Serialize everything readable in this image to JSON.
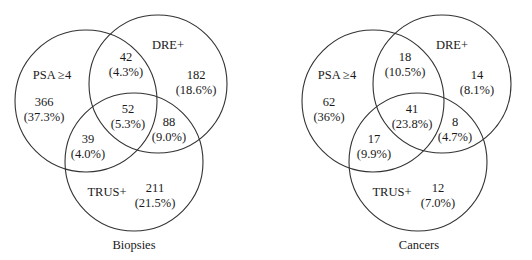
{
  "colors": {
    "background": "#ffffff",
    "stroke": "#333333",
    "text": "#1a1a1a"
  },
  "diagrams": [
    {
      "id": "biopsies",
      "caption": "Biopsies",
      "caption_pos": [
        134,
        246
      ],
      "sets": [
        {
          "name": "psa",
          "label": "PSA ≥4",
          "cx": 86,
          "cy": 101,
          "r": 71,
          "label_pos": [
            52,
            76
          ]
        },
        {
          "name": "dre",
          "label": "DRE+",
          "cx": 158,
          "cy": 84,
          "r": 69,
          "label_pos": [
            168,
            46
          ]
        },
        {
          "name": "trus",
          "label": "TRUS+",
          "cx": 134,
          "cy": 162,
          "r": 69,
          "label_pos": [
            107,
            193
          ]
        }
      ],
      "regions": [
        {
          "name": "psa-only",
          "count": "366",
          "pct": "(37.3%)",
          "pos": [
            44,
            103
          ]
        },
        {
          "name": "psa-dre",
          "count": "42",
          "pct": "(4.3%)",
          "pos": [
            126,
            58
          ]
        },
        {
          "name": "dre-only",
          "count": "182",
          "pct": "(18.6%)",
          "pos": [
            196,
            76
          ]
        },
        {
          "name": "psa-dre-trus",
          "count": "52",
          "pct": "(5.3%)",
          "pos": [
            128,
            110
          ]
        },
        {
          "name": "dre-trus",
          "count": "88",
          "pct": "(9.0%)",
          "pos": [
            169,
            123
          ]
        },
        {
          "name": "psa-trus",
          "count": "39",
          "pct": "(4.0%)",
          "pos": [
            88,
            140
          ]
        },
        {
          "name": "trus-only",
          "count": "211",
          "pct": "(21.5%)",
          "pos": [
            155,
            189
          ]
        }
      ]
    },
    {
      "id": "cancers",
      "caption": "Cancers",
      "caption_pos": [
        419,
        246
      ],
      "sets": [
        {
          "name": "psa",
          "label": "PSA ≥4",
          "cx": 373,
          "cy": 101,
          "r": 71,
          "label_pos": [
            337,
            76
          ]
        },
        {
          "name": "dre",
          "label": "DRE+",
          "cx": 442,
          "cy": 84,
          "r": 69,
          "label_pos": [
            452,
            46
          ]
        },
        {
          "name": "trus",
          "label": "TRUS+",
          "cx": 418,
          "cy": 162,
          "r": 69,
          "label_pos": [
            392,
            193
          ]
        }
      ],
      "regions": [
        {
          "name": "psa-only",
          "count": "62",
          "pct": "(36%)",
          "pos": [
            329,
            103
          ]
        },
        {
          "name": "psa-dre",
          "count": "18",
          "pct": "(10.5%)",
          "pos": [
            405,
            58
          ]
        },
        {
          "name": "dre-only",
          "count": "14",
          "pct": "(8.1%)",
          "pos": [
            477,
            76
          ]
        },
        {
          "name": "psa-dre-trus",
          "count": "41",
          "pct": "(23.8%)",
          "pos": [
            412,
            110
          ]
        },
        {
          "name": "dre-trus",
          "count": "8",
          "pct": "(4.7%)",
          "pos": [
            455,
            123
          ]
        },
        {
          "name": "psa-trus",
          "count": "17",
          "pct": "(9.9%)",
          "pos": [
            374,
            140
          ]
        },
        {
          "name": "trus-only",
          "count": "12",
          "pct": "(7.0%)",
          "pos": [
            438,
            189
          ]
        }
      ]
    }
  ]
}
